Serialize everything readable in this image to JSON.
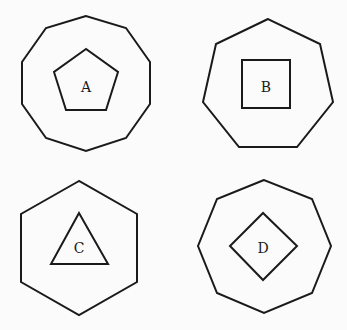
{
  "figures": [
    {
      "id": "A",
      "label": "A",
      "outer": {
        "shape": "decagon",
        "sides": 10,
        "points": "86,16 46,28 22,62 22,104 46,138 86,151 126,138 150,104 150,62 126,28"
      },
      "inner": {
        "shape": "pentagon",
        "sides": 5,
        "points": "86,49 54,72 66,110 106,110 118,72"
      },
      "label_pos": {
        "x": 86,
        "y": 87
      }
    },
    {
      "id": "B",
      "label": "B",
      "outer": {
        "shape": "heptagon",
        "sides": 7,
        "points": "268,19 216,44 203,102 239,147 297,147 333,102 320,44"
      },
      "inner": {
        "shape": "square",
        "sides": 4,
        "points": "242,60 290,60 290,108 242,108"
      },
      "label_pos": {
        "x": 266,
        "y": 87
      }
    },
    {
      "id": "C",
      "label": "C",
      "outer": {
        "shape": "hexagon",
        "sides": 6,
        "points": "79,181 21,214 21,282 79,315 137,282 137,214"
      },
      "inner": {
        "shape": "triangle",
        "sides": 3,
        "points": "79,213 51,264 108,264"
      },
      "label_pos": {
        "x": 79,
        "y": 248
      }
    },
    {
      "id": "D",
      "label": "D",
      "outer": {
        "shape": "octagon",
        "sides": 8,
        "points": "264,180 217,199 198,246 217,293 264,313 312,293 331,246 312,199"
      },
      "inner": {
        "shape": "diamond",
        "sides": 4,
        "points": "263,213 230,246 263,280 297,246"
      },
      "label_pos": {
        "x": 263,
        "y": 248
      }
    }
  ],
  "colors": {
    "stroke": "#1a1a1a",
    "background": "#fbfbfb"
  }
}
